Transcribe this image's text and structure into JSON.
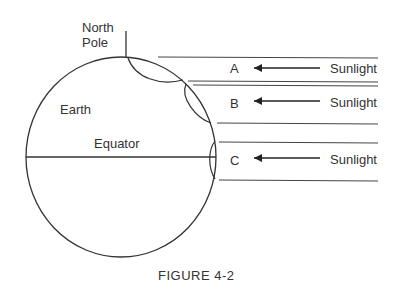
{
  "labels": {
    "north_pole_line1": "North",
    "north_pole_line2": "Pole",
    "earth": "Earth",
    "equator": "Equator"
  },
  "beams": [
    {
      "id": "A",
      "label": "A",
      "source": "Sunlight"
    },
    {
      "id": "B",
      "label": "B",
      "source": "Sunlight"
    },
    {
      "id": "C",
      "label": "C",
      "source": "Sunlight"
    }
  ],
  "caption": "FIGURE 4-2",
  "colors": {
    "stroke": "#333333",
    "background": "#ffffff"
  }
}
